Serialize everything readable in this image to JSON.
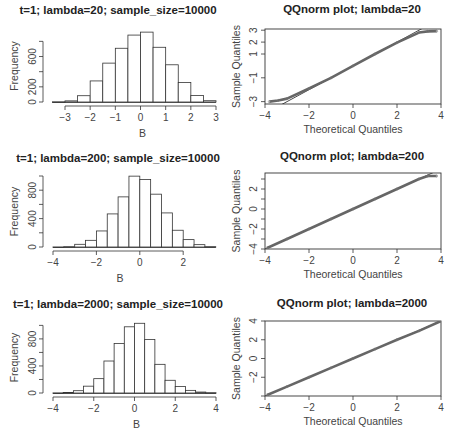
{
  "chart_data": [
    {
      "type": "bar",
      "subtype": "histogram",
      "title": "t=1; lambda=20; sample_size=10000",
      "xlabel": "B",
      "ylabel": "Frequency",
      "bin_width": 0.5,
      "bin_starts": [
        -3.5,
        -3,
        -2.5,
        -2,
        -1.5,
        -1,
        -0.5,
        0,
        0.5,
        1,
        1.5,
        2,
        2.5
      ],
      "values": [
        3,
        15,
        83,
        278,
        513,
        709,
        883,
        922,
        722,
        491,
        257,
        87,
        17
      ],
      "xticks": [
        -3,
        -2,
        -1,
        0,
        1,
        2,
        3
      ],
      "yticks": [
        0,
        200,
        400,
        600,
        800
      ],
      "ytick_labels": [
        "0",
        "200",
        "",
        "600",
        ""
      ],
      "xlim": [
        -3.5,
        3
      ],
      "ylim": [
        0,
        950
      ],
      "grid": false
    },
    {
      "type": "scatter",
      "subtype": "qqnorm",
      "title": "QQnorm plot; lambda=20",
      "xlabel": "Theoretical Quantiles",
      "ylabel": "Sample Quantiles",
      "xticks": [
        -4,
        -2,
        0,
        2,
        4
      ],
      "yticks": [
        -3,
        -1,
        1,
        2,
        3
      ],
      "xlim": [
        -4,
        4
      ],
      "ylim": [
        -3.2,
        3.1
      ],
      "reference_line": {
        "slope": 1.0,
        "intercept": 0
      },
      "points_summary": "nearly linear; tails truncated near ±3 (points flatten at y≈-3 for x<-3 and y≈3 for x>3)",
      "sample_points": [
        [
          -3.8,
          -3.0
        ],
        [
          -3.4,
          -2.9
        ],
        [
          -3.0,
          -2.75
        ],
        [
          -2,
          -1.9
        ],
        [
          -1,
          -1.0
        ],
        [
          0,
          0
        ],
        [
          1,
          1.0
        ],
        [
          2,
          1.95
        ],
        [
          3.0,
          2.8
        ],
        [
          3.4,
          2.9
        ],
        [
          3.8,
          2.92
        ]
      ]
    },
    {
      "type": "bar",
      "subtype": "histogram",
      "title": "t=1; lambda=200; sample_size=10000",
      "xlabel": "B",
      "ylabel": "Frequency",
      "bin_width": 0.5,
      "bin_starts": [
        -4,
        -3.5,
        -3,
        -2.5,
        -2,
        -1.5,
        -1,
        -0.5,
        0,
        0.5,
        1,
        1.5,
        2,
        2.5,
        3
      ],
      "values": [
        1,
        5,
        38,
        94,
        226,
        466,
        706,
        998,
        951,
        744,
        480,
        236,
        104,
        33,
        5
      ],
      "xticks": [
        -4,
        -2,
        0,
        2
      ],
      "yticks": [
        0,
        200,
        400,
        600,
        800,
        1000
      ],
      "ytick_labels": [
        "0",
        "",
        "400",
        "",
        "800",
        ""
      ],
      "xlim": [
        -4,
        3.5
      ],
      "ylim": [
        0,
        1000
      ],
      "grid": false
    },
    {
      "type": "scatter",
      "subtype": "qqnorm",
      "title": "QQnorm plot; lambda=200",
      "xlabel": "Theoretical Quantiles",
      "ylabel": "Sample Quantiles",
      "xticks": [
        -4,
        -2,
        0,
        2,
        4
      ],
      "yticks": [
        -4,
        -3,
        -2,
        -1,
        0,
        1,
        2,
        3
      ],
      "ytick_labels": [
        "-4",
        "",
        "-2",
        "",
        "0",
        "",
        "2",
        ""
      ],
      "xlim": [
        -4,
        4
      ],
      "ylim": [
        -4,
        3.6
      ],
      "reference_line": {
        "slope": 1.0,
        "intercept": 0
      },
      "points_summary": "almost perfectly linear; slight flattening at upper tail near 3.3",
      "sample_points": [
        [
          -3.9,
          -3.9
        ],
        [
          -3,
          -3.0
        ],
        [
          -2,
          -2.0
        ],
        [
          -1,
          -1.0
        ],
        [
          0,
          0
        ],
        [
          1,
          1.0
        ],
        [
          2,
          2.0
        ],
        [
          3,
          3.0
        ],
        [
          3.4,
          3.3
        ],
        [
          3.8,
          3.3
        ]
      ]
    },
    {
      "type": "bar",
      "subtype": "histogram",
      "title": "t=1; lambda=2000; sample_size=10000",
      "xlabel": "B",
      "ylabel": "Frequency",
      "bin_width": 0.5,
      "bin_starts": [
        -4,
        -3.5,
        -3,
        -2.5,
        -2,
        -1.5,
        -1,
        -0.5,
        0,
        0.5,
        1,
        1.5,
        2,
        2.5,
        3,
        3.5
      ],
      "values": [
        2,
        7,
        34,
        101,
        212,
        473,
        733,
        979,
        1031,
        791,
        424,
        188,
        96,
        39,
        14,
        5
      ],
      "xticks": [
        -4,
        -2,
        0,
        2,
        4
      ],
      "yticks": [
        0,
        200,
        400,
        600,
        800,
        1000
      ],
      "ytick_labels": [
        "0",
        "",
        "400",
        "",
        "800",
        ""
      ],
      "xlim": [
        -4,
        4
      ],
      "ylim": [
        0,
        1050
      ],
      "grid": false
    },
    {
      "type": "scatter",
      "subtype": "qqnorm",
      "title": "QQnorm plot; lambda=2000",
      "xlabel": "Theoretical Quantiles",
      "ylabel": "Sample Quantiles",
      "xticks": [
        -4,
        -2,
        0,
        2,
        4
      ],
      "yticks": [
        -4,
        -2,
        0,
        2,
        4
      ],
      "ytick_labels": [
        "",
        "-2",
        "0",
        "2",
        "4"
      ],
      "xlim": [
        -4,
        4
      ],
      "ylim": [
        -4,
        4
      ],
      "reference_line": {
        "slope": 1.0,
        "intercept": 0
      },
      "points_summary": "linear across the full range",
      "sample_points": [
        [
          -3.9,
          -3.9
        ],
        [
          -3,
          -3.0
        ],
        [
          -2,
          -2.0
        ],
        [
          -1,
          -1.0
        ],
        [
          0,
          0
        ],
        [
          1,
          1.0
        ],
        [
          2,
          2.0
        ],
        [
          3,
          2.95
        ],
        [
          4,
          4.0
        ]
      ]
    }
  ],
  "layout": {
    "panels": [
      {
        "x0": 53,
        "x1": 216,
        "y0": 30,
        "y1": 102,
        "ax_y": 106,
        "title_y": 14,
        "ylab_x": 12
      },
      {
        "x0": 265,
        "x1": 441,
        "y0": 29,
        "y1": 104,
        "ax_y": 107,
        "title_y": 13,
        "ylab_x": 232
      },
      {
        "x0": 53,
        "x1": 216,
        "y0": 176,
        "y1": 247,
        "ax_y": 251,
        "title_y": 162,
        "ylab_x": 12
      },
      {
        "x0": 265,
        "x1": 441,
        "y0": 173,
        "y1": 249,
        "ax_y": 252,
        "title_y": 160,
        "ylab_x": 232
      },
      {
        "x0": 53,
        "x1": 216,
        "y0": 322,
        "y1": 393,
        "ax_y": 397,
        "title_y": 308,
        "ylab_x": 12
      },
      {
        "x0": 265,
        "x1": 441,
        "y0": 321,
        "y1": 396,
        "ax_y": 399,
        "title_y": 307,
        "ylab_x": 232
      }
    ]
  }
}
